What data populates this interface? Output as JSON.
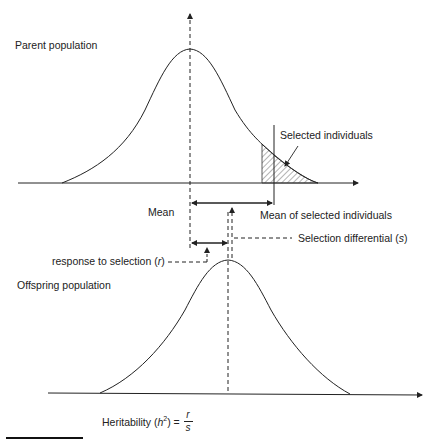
{
  "diagram": {
    "labels": {
      "parent_population": "Parent population",
      "selected_individuals": "Selected individuals",
      "mean": "Mean",
      "mean_of_selected": "Mean of selected individuals",
      "selection_differential_prefix": "Selection differential (",
      "selection_differential_var": "s",
      "selection_differential_suffix": ")",
      "response_prefix": "response to selection (",
      "response_var": "r",
      "response_suffix": ")",
      "offspring_population": "Offspring population",
      "heritability_prefix": "Heritability (",
      "heritability_var": "h",
      "heritability_exp": "2",
      "heritability_suffix": ") = ",
      "fraction_numerator": "r",
      "fraction_denominator": "s"
    },
    "colors": {
      "line": "#222222",
      "hatch": "#444444",
      "background": "#ffffff"
    }
  }
}
